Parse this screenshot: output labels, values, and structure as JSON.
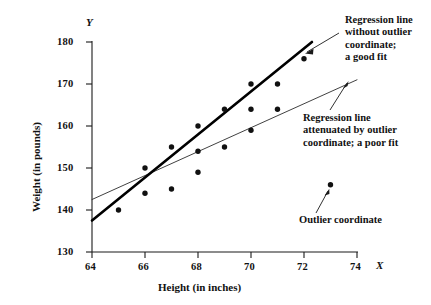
{
  "chart_data": {
    "type": "scatter",
    "title": "",
    "xlabel": "Height (in inches)",
    "ylabel": "Weight (in pounds)",
    "x_axis_symbol": "X",
    "y_axis_symbol": "Y",
    "xlim": [
      64,
      74
    ],
    "ylim": [
      130,
      180
    ],
    "xticks": [
      64,
      66,
      68,
      70,
      72,
      74
    ],
    "yticks": [
      130,
      140,
      150,
      160,
      170,
      180
    ],
    "xtick_labels": [
      "64",
      "66",
      "68",
      "70",
      "72",
      "74"
    ],
    "ytick_labels": [
      "130",
      "140",
      "150",
      "160",
      "170",
      "180"
    ],
    "grid": false,
    "legend": "none",
    "points": [
      {
        "x": 65,
        "y": 140
      },
      {
        "x": 66,
        "y": 150
      },
      {
        "x": 66,
        "y": 144
      },
      {
        "x": 67,
        "y": 155
      },
      {
        "x": 67,
        "y": 145
      },
      {
        "x": 68,
        "y": 160
      },
      {
        "x": 68,
        "y": 154
      },
      {
        "x": 68,
        "y": 149
      },
      {
        "x": 69,
        "y": 164
      },
      {
        "x": 69,
        "y": 155
      },
      {
        "x": 70,
        "y": 170
      },
      {
        "x": 70,
        "y": 164
      },
      {
        "x": 70,
        "y": 159
      },
      {
        "x": 71,
        "y": 170
      },
      {
        "x": 71,
        "y": 164
      },
      {
        "x": 72,
        "y": 176
      },
      {
        "x": 73,
        "y": 146
      }
    ],
    "outlier_point": {
      "x": 73,
      "y": 146
    },
    "series": [
      {
        "name": "Regression line without outlier coordinate; a good fit",
        "type": "line",
        "style": "thick",
        "x": [
          64,
          72.3
        ],
        "y": [
          137.5,
          180
        ]
      },
      {
        "name": "Regression line attenuated by outlier coordinate; a poor fit",
        "type": "line",
        "style": "thin",
        "x": [
          64,
          74
        ],
        "y": [
          142.5,
          171
        ]
      }
    ]
  },
  "annotations": {
    "good_fit": "Regression line\nwithout outlier\ncoordinate;\na good fit",
    "poor_fit": "Regression line\nattenuated by outlier\ncoordinate; a poor fit",
    "outlier": "Outlier coordinate"
  },
  "colors": {
    "ink": "#111111",
    "thick_line": "#000000",
    "thin_line": "#2b2b2b",
    "background": "#ffffff"
  }
}
